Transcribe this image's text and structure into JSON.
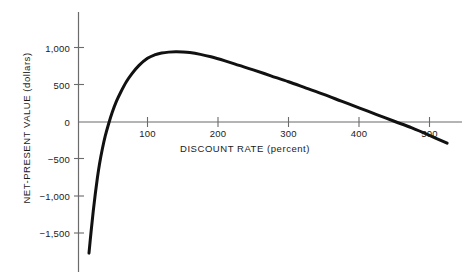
{
  "chart_data": {
    "type": "line",
    "title": "",
    "subtitle": "",
    "xlabel": "DISCOUNT RATE (percent)",
    "ylabel": "NET-PRESENT VALUE (dollars)",
    "xlim": [
      -20,
      555
    ],
    "ylim": [
      -1800,
      1250
    ],
    "grid": false,
    "legend": null,
    "x_ticks": [
      {
        "value": 100,
        "label": "100"
      },
      {
        "value": 200,
        "label": "200"
      },
      {
        "value": 300,
        "label": "300"
      },
      {
        "value": 400,
        "label": "400"
      },
      {
        "value": 500,
        "label": "500"
      }
    ],
    "y_ticks": [
      {
        "value": 1000,
        "label": "1,000"
      },
      {
        "value": 500,
        "label": "500"
      },
      {
        "value": 0,
        "label": "0"
      },
      {
        "value": -500,
        "label": "−500"
      },
      {
        "value": -1000,
        "label": "−1,000"
      },
      {
        "value": -1500,
        "label": "−1,500"
      }
    ],
    "series": [
      {
        "name": "Net-present value",
        "color": "#111111",
        "line_width": 3,
        "x": [
          17,
          20,
          23,
          26,
          29,
          32,
          36,
          40,
          45,
          50,
          56,
          62,
          70,
          78,
          88,
          100,
          110,
          120,
          130,
          140,
          150,
          160,
          175,
          190,
          210,
          230,
          250,
          275,
          300,
          325,
          350,
          375,
          400,
          425,
          450,
          475,
          500,
          525
        ],
        "y": [
          -1760,
          -1470,
          -1200,
          -960,
          -745,
          -560,
          -360,
          -190,
          -20,
          130,
          280,
          400,
          540,
          650,
          760,
          855,
          900,
          925,
          938,
          942,
          940,
          932,
          908,
          875,
          820,
          760,
          700,
          620,
          540,
          455,
          370,
          280,
          190,
          100,
          10,
          -80,
          -180,
          -285
        ]
      }
    ],
    "zero_crossings": [
      47,
      393
    ],
    "peak": {
      "x": 140,
      "y": 942
    },
    "annotations": []
  },
  "figure": {
    "background_color": "#ffffff",
    "axis_color": "#6b6b6b",
    "curve_color": "#111111",
    "text_color": "#1a1a1a"
  }
}
